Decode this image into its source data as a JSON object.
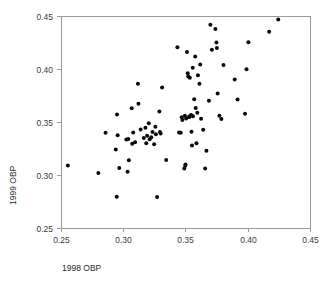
{
  "chart_data": {
    "type": "scatter",
    "title": "",
    "xlabel": "1998 OBP",
    "ylabel": "1999 OBP",
    "xlim": [
      0.25,
      0.45
    ],
    "ylim": [
      0.25,
      0.45
    ],
    "xticks": [
      "0.25",
      "0.30",
      "0.35",
      "0.40",
      "0.45"
    ],
    "yticks": [
      "0.25",
      "0.30",
      "0.35",
      "0.40",
      "0.45"
    ],
    "xtick_values": [
      0.25,
      0.3,
      0.35,
      0.4,
      0.45
    ],
    "ytick_values": [
      0.25,
      0.3,
      0.35,
      0.4,
      0.45
    ],
    "grid": false,
    "legend": null,
    "marker": "filled-circle",
    "marker_color": "#0a0a0a",
    "frame_color": "#9a9a9a",
    "points": [
      [
        0.2555,
        0.309
      ],
      [
        0.28,
        0.3018
      ],
      [
        0.2858,
        0.3398
      ],
      [
        0.294,
        0.324
      ],
      [
        0.2948,
        0.2795
      ],
      [
        0.295,
        0.357
      ],
      [
        0.2955,
        0.3375
      ],
      [
        0.2968,
        0.3065
      ],
      [
        0.3025,
        0.3335
      ],
      [
        0.3035,
        0.303
      ],
      [
        0.304,
        0.334
      ],
      [
        0.3045,
        0.314
      ],
      [
        0.3068,
        0.363
      ],
      [
        0.3072,
        0.3295
      ],
      [
        0.308,
        0.34
      ],
      [
        0.3095,
        0.331
      ],
      [
        0.3118,
        0.386
      ],
      [
        0.3122,
        0.3672
      ],
      [
        0.314,
        0.343
      ],
      [
        0.3165,
        0.335
      ],
      [
        0.3178,
        0.3445
      ],
      [
        0.3185,
        0.33
      ],
      [
        0.3192,
        0.337
      ],
      [
        0.3205,
        0.3488
      ],
      [
        0.3212,
        0.3338
      ],
      [
        0.3225,
        0.3355
      ],
      [
        0.3235,
        0.3405
      ],
      [
        0.3248,
        0.329
      ],
      [
        0.3258,
        0.3455
      ],
      [
        0.3262,
        0.3385
      ],
      [
        0.3272,
        0.2792
      ],
      [
        0.329,
        0.36
      ],
      [
        0.3295,
        0.3405
      ],
      [
        0.33,
        0.3392
      ],
      [
        0.3312,
        0.3825
      ],
      [
        0.3345,
        0.3142
      ],
      [
        0.3435,
        0.4205
      ],
      [
        0.3448,
        0.34
      ],
      [
        0.3462,
        0.3398
      ],
      [
        0.347,
        0.3545
      ],
      [
        0.3475,
        0.352
      ],
      [
        0.349,
        0.3062
      ],
      [
        0.3495,
        0.3558
      ],
      [
        0.3498,
        0.3088
      ],
      [
        0.35,
        0.3098
      ],
      [
        0.3505,
        0.3532
      ],
      [
        0.3512,
        0.416
      ],
      [
        0.3518,
        0.396
      ],
      [
        0.3522,
        0.393
      ],
      [
        0.3528,
        0.355
      ],
      [
        0.3532,
        0.3548
      ],
      [
        0.3535,
        0.3918
      ],
      [
        0.354,
        0.3562
      ],
      [
        0.3545,
        0.3565
      ],
      [
        0.3548,
        0.3408
      ],
      [
        0.3552,
        0.3278
      ],
      [
        0.3558,
        0.4012
      ],
      [
        0.356,
        0.3555
      ],
      [
        0.357,
        0.3715
      ],
      [
        0.3578,
        0.4118
      ],
      [
        0.3582,
        0.3632
      ],
      [
        0.3588,
        0.33
      ],
      [
        0.3595,
        0.3588
      ],
      [
        0.36,
        0.3942
      ],
      [
        0.3612,
        0.3862
      ],
      [
        0.3618,
        0.4042
      ],
      [
        0.3625,
        0.353
      ],
      [
        0.3642,
        0.3428
      ],
      [
        0.3658,
        0.3062
      ],
      [
        0.3668,
        0.3228
      ],
      [
        0.3688,
        0.37
      ],
      [
        0.37,
        0.4418
      ],
      [
        0.3712,
        0.4182
      ],
      [
        0.374,
        0.4378
      ],
      [
        0.3748,
        0.425
      ],
      [
        0.3752,
        0.4198
      ],
      [
        0.3758,
        0.3768
      ],
      [
        0.3772,
        0.3558
      ],
      [
        0.3788,
        0.3528
      ],
      [
        0.3805,
        0.4038
      ],
      [
        0.3895,
        0.3902
      ],
      [
        0.3918,
        0.3712
      ],
      [
        0.3978,
        0.3578
      ],
      [
        0.399,
        0.3998
      ],
      [
        0.4005,
        0.4252
      ],
      [
        0.4172,
        0.4352
      ],
      [
        0.4245,
        0.4468
      ]
    ]
  },
  "layout": {
    "plot_left": 61,
    "plot_right": 310,
    "plot_top": 16,
    "plot_bottom": 228,
    "marker_radius": 2.0,
    "xlabel_x": 62,
    "xlabel_y": 271,
    "ylabel_x": 16,
    "ylabel_y": 205
  }
}
